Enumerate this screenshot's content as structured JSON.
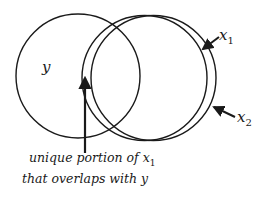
{
  "diagram": {
    "circles": [
      {
        "id": "y",
        "label": "y",
        "cx": 78,
        "cy": 76,
        "r": 62
      },
      {
        "id": "x1",
        "label": "x",
        "subscript": "1",
        "cx": 144.5,
        "cy": 78,
        "r": 62.5
      },
      {
        "id": "x2",
        "label": "x",
        "subscript": "2",
        "cx": 153.5,
        "cy": 78,
        "r": 62.5
      }
    ],
    "labels": {
      "y": "y",
      "x1_main": "x",
      "x1_sub": "1",
      "x2_main": "x",
      "x2_sub": "2"
    },
    "caption": {
      "line1_prefix": "unique portion of x",
      "line1_sub": "1",
      "line2": "that overlaps with y"
    },
    "stroke_color": "#1a1a1a"
  }
}
